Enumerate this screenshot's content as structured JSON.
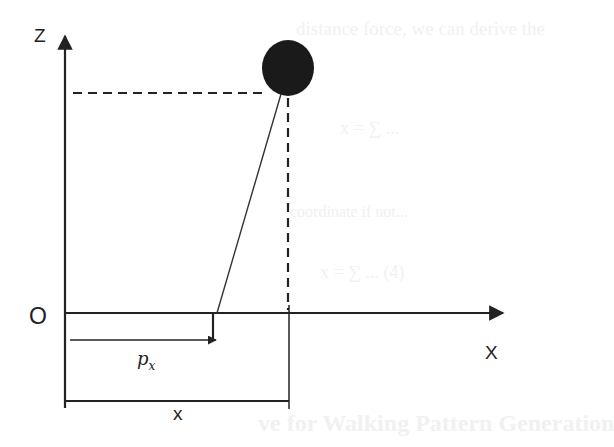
{
  "diagram": {
    "labels": {
      "z_axis": "Z",
      "x_axis": "X",
      "origin": "O",
      "pivot_offset": "p",
      "pivot_offset_sub": "x",
      "mass_x": "x"
    },
    "colors": {
      "stroke": "#222222",
      "mass": "#1a1a1a",
      "background": "#ffffff",
      "bleed_text": "#f1f1f1"
    },
    "elements": {
      "z_axis": {
        "x": 65,
        "y_top": 33,
        "y_bottom": 408
      },
      "x_axis": {
        "y": 313,
        "x_left": 65,
        "x_right": 505
      },
      "mass": {
        "cx": 288,
        "cy": 68,
        "r": 27
      },
      "horizontal_dashed": {
        "y": 93,
        "x_from": 73,
        "x_to": 262
      },
      "vertical_dashed": {
        "x": 288,
        "y_from": 97,
        "y_to": 310
      },
      "leg_line": {
        "x1": 217,
        "y1": 313,
        "x2": 281,
        "y2": 95
      },
      "px_arrow": {
        "y": 340,
        "x_from": 70,
        "x_to": 217
      },
      "x_bracket": {
        "y": 401,
        "x_from": 65,
        "x_to": 289
      }
    }
  },
  "bleed_through": {
    "line1": "distance force, we can derive the",
    "line2": "x = ∑ ...",
    "line3": "coordinate if not...",
    "line4": "x = ∑ ... (4)",
    "line5": "ve for Walking Pattern Generation"
  }
}
